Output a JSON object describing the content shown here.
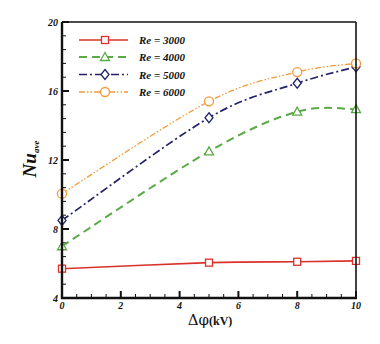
{
  "chart_data": {
    "type": "line",
    "title": "",
    "xlabel": "Δφ",
    "xlabel_unit": "(kV)",
    "ylabel": "Nu",
    "ylabel_sub": "ave",
    "xlim": [
      0,
      10
    ],
    "ylim": [
      4,
      20
    ],
    "xticks": [
      0,
      2,
      4,
      6,
      8,
      10
    ],
    "yticks": [
      4,
      8,
      12,
      16,
      20
    ],
    "x_minor_step": 0.5,
    "y_minor_step": 0.8,
    "grid": false,
    "legend_position": "upper left",
    "x": [
      0,
      5,
      8,
      10
    ],
    "series": [
      {
        "name": "Re = 3000",
        "values": [
          5.7,
          6.05,
          6.1,
          6.15
        ],
        "color": "#d8322a",
        "line_style": "solid",
        "marker": "square"
      },
      {
        "name": "Re = 4000",
        "values": [
          7.0,
          12.5,
          14.8,
          14.95
        ],
        "color": "#5aaa46",
        "line_style": "dashed",
        "marker": "triangle"
      },
      {
        "name": "Re = 5000",
        "values": [
          8.5,
          14.45,
          16.45,
          17.4
        ],
        "color": "#22226a",
        "line_style": "dash-dot",
        "marker": "diamond"
      },
      {
        "name": "Re = 6000",
        "values": [
          10.05,
          15.4,
          17.1,
          17.6
        ],
        "color": "#f29b38",
        "line_style": "dash-dot-dot",
        "marker": "circle"
      }
    ]
  }
}
